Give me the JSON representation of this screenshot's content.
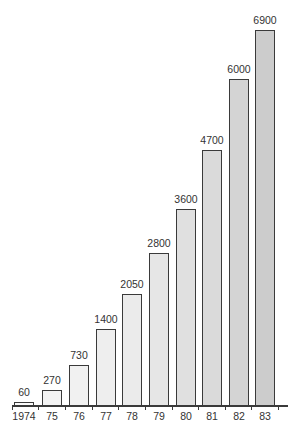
{
  "chart_data": {
    "type": "bar",
    "title": "",
    "xlabel": "",
    "ylabel": "",
    "categories": [
      "1974",
      "75",
      "76",
      "77",
      "78",
      "79",
      "80",
      "81",
      "82",
      "83"
    ],
    "values": [
      60,
      270,
      730,
      1400,
      2050,
      2800,
      3600,
      4700,
      6000,
      6900
    ],
    "data_labels": [
      "60",
      "270",
      "730",
      "1400",
      "2050",
      "2800",
      "3600",
      "4700",
      "6000",
      "6900"
    ],
    "ylim": [
      0,
      6900
    ],
    "grid": false,
    "legend": null,
    "bar_fill_gradient": [
      "#fbfbfb",
      "#f3f3f3",
      "#f1f1f1",
      "#eeeeee",
      "#ebebeb",
      "#e6e6e6",
      "#e0e0e0",
      "#dadada",
      "#d4d4d4",
      "#cccccc"
    ],
    "bar_border_color": "#3a3a3a"
  }
}
